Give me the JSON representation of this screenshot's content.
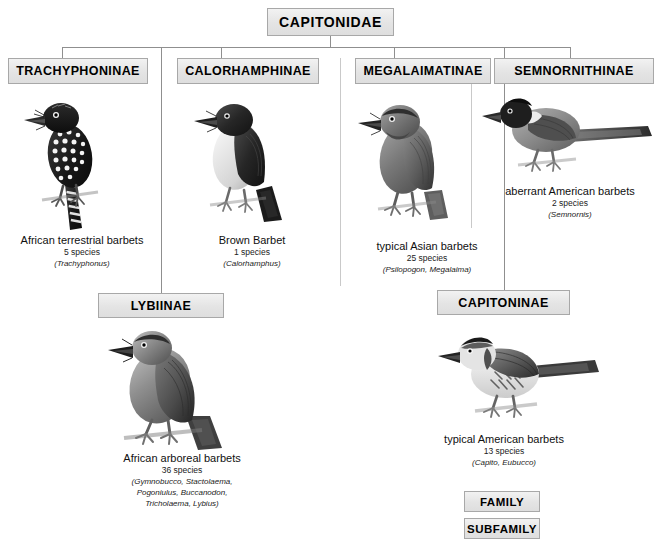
{
  "diagram": {
    "family": {
      "label": "CAPITONIDAE"
    },
    "subfamilies": [
      {
        "id": "trachyphoninae",
        "label": "TRACHYPHONINAE",
        "common_name": "African terrestrial barbets",
        "species_count": "5 species",
        "genera": "(Trachyphonus)"
      },
      {
        "id": "calorhamphinae",
        "label": "CALORHAMPHINAE",
        "common_name": "Brown Barbet",
        "species_count": "1 species",
        "genera": "(Calorhamphus)"
      },
      {
        "id": "megalaimatinae",
        "label": "MEGALAIMATINAE",
        "common_name": "typical Asian barbets",
        "species_count": "25 species",
        "genera": "(Psilopogon, Megalaima)"
      },
      {
        "id": "semnornithinae",
        "label": "SEMNORNITHINAE",
        "common_name": "aberrant American barbets",
        "species_count": "2 species",
        "genera": "(Semnornis)"
      },
      {
        "id": "lybiinae",
        "label": "LYBIINAE",
        "common_name": "African arboreal barbets",
        "species_count": "36 species",
        "genera_line1": "(Gymnobucco, Stactolaema,",
        "genera_line2": "Pogoniulus, Buccanodon,",
        "genera_line3": "Tricholaema, Lybius)"
      },
      {
        "id": "capitoninae",
        "label": "CAPITONINAE",
        "common_name": "typical American barbets",
        "species_count": "13 species",
        "genera": "(Capito, Eubucco)"
      }
    ],
    "legend": [
      {
        "id": "family",
        "label": "FAMILY"
      },
      {
        "id": "subfamily",
        "label": "SUBFAMILY"
      }
    ],
    "colors": {
      "box_border": "#a8a8a8",
      "box_fill": "#e8e8e8",
      "connector": "#8f8f8f",
      "divider": "#c9c9c9",
      "text": "#000000"
    }
  }
}
